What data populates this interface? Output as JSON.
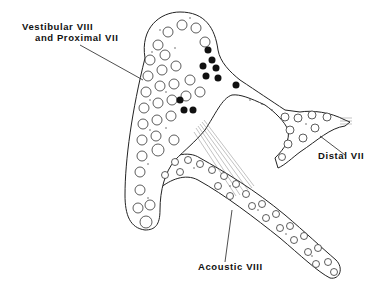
{
  "diagram": {
    "type": "anatomical-schematic",
    "labels": {
      "vestibular": "Vestibular VIII",
      "vestibular_line2": "and Proximal VII",
      "distal": "Distal VII",
      "acoustic": "Acoustic VIII"
    },
    "legend_marks": {
      "open_circles": "nerve fibers",
      "filled_circles": "facial nerve fibers (proximal VII)",
      "stippling": "connective tissue"
    },
    "colors": {
      "ink": "#111111",
      "background": "#ffffff"
    }
  }
}
